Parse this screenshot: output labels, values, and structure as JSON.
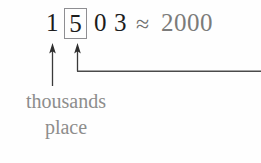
{
  "figure": {
    "type": "rounding-place-value-diagram",
    "background_color": "#fefefe"
  },
  "expression": {
    "digits": [
      {
        "value": "1",
        "place": "thousands",
        "boxed": false
      },
      {
        "value": "5",
        "place": "hundreds",
        "boxed": true
      },
      {
        "value": "0",
        "place": "tens",
        "boxed": false
      },
      {
        "value": "3",
        "place": "ones",
        "boxed": false
      }
    ],
    "number": "1503",
    "approx_symbol": "≈",
    "rounded_value": "2000",
    "digit_color": "#1c1c1c",
    "rounded_color": "#7b7b7a",
    "box_border_color": "#8e8e92"
  },
  "annotations": {
    "caption_line1": "thousands",
    "caption_line2": "place",
    "caption_color": "#8d8d8c",
    "arrows": [
      {
        "name": "thousands-place-arrow",
        "points_to": "1",
        "direction": "up"
      },
      {
        "name": "hundreds-digit-arrow",
        "points_to": "5",
        "direction": "up",
        "has_elbow_connector": true
      }
    ],
    "connector_color": "#3a3a3a"
  }
}
